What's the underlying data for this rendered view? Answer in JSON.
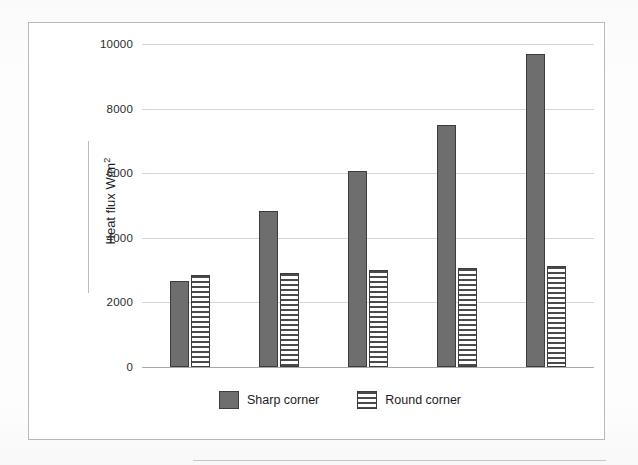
{
  "chart_data": {
    "type": "bar",
    "title": "",
    "xlabel": "",
    "ylabel": "Heat flux W/m",
    "ylabel_superscript": "2",
    "ylim": [
      0,
      10000
    ],
    "ytick_labels": [
      "10000",
      "8000",
      "6000",
      "4000",
      "2000",
      "0"
    ],
    "yticks": [
      10000,
      8000,
      6000,
      4000,
      2000,
      0
    ],
    "grid": true,
    "legend_position": "bottom-center",
    "categories": [
      "1",
      "2",
      "3",
      "4",
      "5"
    ],
    "series": [
      {
        "name": "Sharp corner",
        "style": "solid-gray",
        "color": "#6e6e6e",
        "values": [
          2650,
          4830,
          6080,
          7500,
          9680
        ]
      },
      {
        "name": "Round corner",
        "style": "horizontal-stripes",
        "color": "#ffffff",
        "values": [
          2840,
          2920,
          3010,
          3080,
          3120
        ]
      }
    ]
  },
  "legend": {
    "items": [
      {
        "label": "Sharp corner",
        "swatch": "solid-gray-swatch"
      },
      {
        "label": "Round corner",
        "swatch": "striped-swatch"
      }
    ]
  },
  "colors": {
    "bar_solid_fill": "#6e6e6e",
    "bar_border": "#3c3c3c",
    "stripe": "#4a4a4a",
    "gridline": "#d6d6d6",
    "frame_border": "#b9b9b9",
    "text": "#262626",
    "background": "#ffffff"
  }
}
